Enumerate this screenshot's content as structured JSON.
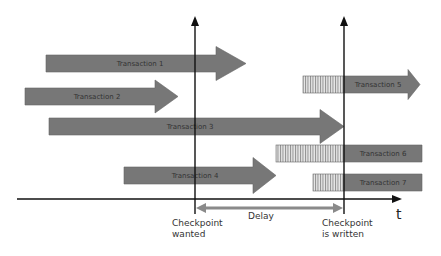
{
  "colors": {
    "bar": "#777777",
    "bar_stroke": "#666666",
    "hatch_bg": "#e6e6e6",
    "hatch_line": "#888888",
    "axis": "#111111",
    "delay": "#8a8a8a"
  },
  "transactions": [
    {
      "label": "Transaction 1",
      "start": 0.2,
      "end": 0.35,
      "shape": "arrow",
      "hatched_from": null
    },
    {
      "label": "Transaction 2",
      "start": 0.05,
      "end": 0.25,
      "shape": "arrow",
      "hatched_from": null
    },
    {
      "label": "Transaction 3",
      "start": 0.21,
      "end": 0.52,
      "shape": "arrow",
      "hatched_from": null
    },
    {
      "label": "Transaction 4",
      "start": 0.35,
      "end": 0.41,
      "shape": "arrow",
      "hatched_from": null
    },
    {
      "label": "Transaction 5",
      "start": 0.45,
      "end": 0.62,
      "shape": "arrow",
      "hatched_from": 0.45
    },
    {
      "label": "Transaction 6",
      "start": 0.41,
      "end": 0.63,
      "shape": "bar",
      "hatched_from": 0.41
    },
    {
      "label": "Transaction 7",
      "start": 0.47,
      "end": 0.63,
      "shape": "bar",
      "hatched_from": 0.47
    }
  ],
  "axis": {
    "label": "t"
  },
  "markers": {
    "checkpoint_wanted": [
      "Checkpoint",
      "wanted"
    ],
    "checkpoint_written": [
      "Checkpoint",
      "is written"
    ],
    "delay": "Delay"
  }
}
